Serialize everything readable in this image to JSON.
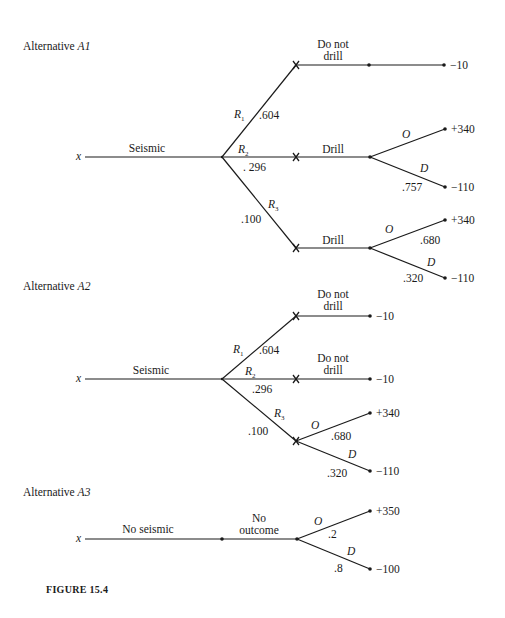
{
  "figure_caption": "FIGURE 15.4",
  "alternatives": [
    {
      "id": "A1",
      "title_prefix": "Alternative ",
      "title_var": "A1",
      "title_pos": [
        23,
        50
      ],
      "root": {
        "label": "x",
        "pos": [
          76,
          160
        ]
      },
      "nodes": [
        {
          "id": "c1",
          "pos": [
            222,
            157
          ],
          "type": "chance"
        },
        {
          "id": "d1",
          "pos": [
            296,
            65
          ],
          "type": "decision-x"
        },
        {
          "id": "d2",
          "pos": [
            296,
            157
          ],
          "type": "decision-x"
        },
        {
          "id": "d3",
          "pos": [
            296,
            248
          ],
          "type": "decision-x"
        },
        {
          "id": "n1",
          "pos": [
            369,
            65
          ],
          "type": "dot"
        },
        {
          "id": "n2",
          "pos": [
            370,
            157
          ],
          "type": "dot"
        },
        {
          "id": "n3",
          "pos": [
            370,
            248
          ],
          "type": "dot"
        },
        {
          "id": "e1",
          "pos": [
            444,
            65
          ],
          "type": "dot"
        },
        {
          "id": "e2",
          "pos": [
            445,
            129
          ],
          "type": "dot"
        },
        {
          "id": "e3",
          "pos": [
            445,
            187
          ],
          "type": "dot"
        },
        {
          "id": "e4",
          "pos": [
            445,
            220
          ],
          "type": "dot"
        },
        {
          "id": "e5",
          "pos": [
            445,
            278
          ],
          "type": "dot"
        }
      ],
      "edges": [
        {
          "from": [
            85,
            157
          ],
          "to": [
            222,
            157
          ]
        },
        {
          "from": [
            222,
            157
          ],
          "to": [
            296,
            65
          ]
        },
        {
          "from": [
            222,
            157
          ],
          "to": [
            296,
            157
          ]
        },
        {
          "from": [
            222,
            157
          ],
          "to": [
            296,
            248
          ]
        },
        {
          "from": [
            296,
            65
          ],
          "to": [
            444,
            65
          ]
        },
        {
          "from": [
            296,
            157
          ],
          "to": [
            370,
            157
          ]
        },
        {
          "from": [
            370,
            157
          ],
          "to": [
            445,
            129
          ]
        },
        {
          "from": [
            370,
            157
          ],
          "to": [
            445,
            187
          ]
        },
        {
          "from": [
            296,
            248
          ],
          "to": [
            370,
            248
          ]
        },
        {
          "from": [
            370,
            248
          ],
          "to": [
            445,
            220
          ]
        },
        {
          "from": [
            370,
            248
          ],
          "to": [
            445,
            278
          ]
        }
      ],
      "labels": [
        {
          "text": "Seismic",
          "pos": [
            147,
            152
          ],
          "anchor": "middle",
          "italic": false
        },
        {
          "text": "Do not",
          "pos": [
            333,
            48
          ],
          "anchor": "middle",
          "italic": false
        },
        {
          "text": "drill",
          "pos": [
            333,
            60
          ],
          "anchor": "middle",
          "italic": false
        },
        {
          "text": "R",
          "sub": "1",
          "pos": [
            234,
            118
          ],
          "anchor": "start",
          "italic": true
        },
        {
          "text": ".604",
          "pos": [
            259,
            119
          ],
          "anchor": "start",
          "italic": false
        },
        {
          "text": "R",
          "sub": "2",
          "pos": [
            238,
            153
          ],
          "anchor": "start",
          "italic": true
        },
        {
          "text": ". 296",
          "pos": [
            243,
            171
          ],
          "anchor": "start",
          "italic": false
        },
        {
          "text": "R",
          "sub": "3",
          "pos": [
            268,
            208
          ],
          "anchor": "start",
          "italic": true
        },
        {
          "text": ".100",
          "pos": [
            241,
            223
          ],
          "anchor": "start",
          "italic": false
        },
        {
          "text": "Drill",
          "pos": [
            333,
            153
          ],
          "anchor": "middle",
          "italic": false
        },
        {
          "text": "O",
          "pos": [
            402,
            138
          ],
          "anchor": "start",
          "italic": true
        },
        {
          "text": "D",
          "pos": [
            420,
            172
          ],
          "anchor": "start",
          "italic": true
        },
        {
          "text": ".757",
          "pos": [
            402,
            191
          ],
          "anchor": "start",
          "italic": false
        },
        {
          "text": "Drill",
          "pos": [
            333,
            244
          ],
          "anchor": "middle",
          "italic": false
        },
        {
          "text": "O",
          "pos": [
            385,
            233
          ],
          "anchor": "start",
          "italic": true
        },
        {
          "text": ".680",
          "pos": [
            420,
            244
          ],
          "anchor": "start",
          "italic": false
        },
        {
          "text": "D",
          "pos": [
            427,
            266
          ],
          "anchor": "start",
          "italic": true
        },
        {
          "text": ".320",
          "pos": [
            403,
            282
          ],
          "anchor": "start",
          "italic": false
        }
      ],
      "payoffs": [
        {
          "text": "−10",
          "pos": [
            450,
            69
          ]
        },
        {
          "text": "+340",
          "pos": [
            451,
            133
          ]
        },
        {
          "text": "−110",
          "pos": [
            451,
            191
          ]
        },
        {
          "text": "+340",
          "pos": [
            451,
            224
          ]
        },
        {
          "text": "−110",
          "pos": [
            451,
            282
          ]
        }
      ]
    },
    {
      "id": "A2",
      "title_prefix": "Alternative ",
      "title_var": "A2",
      "title_pos": [
        23,
        290
      ],
      "root": {
        "label": "x",
        "pos": [
          76,
          382
        ]
      },
      "nodes": [
        {
          "id": "c1",
          "pos": [
            222,
            379
          ],
          "type": "chance"
        },
        {
          "id": "d1",
          "pos": [
            296,
            316
          ],
          "type": "decision-x"
        },
        {
          "id": "d2",
          "pos": [
            296,
            379
          ],
          "type": "decision-x"
        },
        {
          "id": "d3",
          "pos": [
            296,
            441
          ],
          "type": "decision-x"
        },
        {
          "id": "e1",
          "pos": [
            370,
            316
          ],
          "type": "dot"
        },
        {
          "id": "e2",
          "pos": [
            370,
            379
          ],
          "type": "dot"
        },
        {
          "id": "e3",
          "pos": [
            370,
            413
          ],
          "type": "dot"
        },
        {
          "id": "e4",
          "pos": [
            370,
            471
          ],
          "type": "dot"
        }
      ],
      "edges": [
        {
          "from": [
            85,
            379
          ],
          "to": [
            222,
            379
          ]
        },
        {
          "from": [
            222,
            379
          ],
          "to": [
            296,
            316
          ]
        },
        {
          "from": [
            222,
            379
          ],
          "to": [
            296,
            379
          ]
        },
        {
          "from": [
            222,
            379
          ],
          "to": [
            296,
            441
          ]
        },
        {
          "from": [
            296,
            316
          ],
          "to": [
            370,
            316
          ]
        },
        {
          "from": [
            296,
            379
          ],
          "to": [
            370,
            379
          ]
        },
        {
          "from": [
            296,
            441
          ],
          "to": [
            370,
            413
          ]
        },
        {
          "from": [
            296,
            441
          ],
          "to": [
            370,
            471
          ]
        }
      ],
      "labels": [
        {
          "text": "Seismic",
          "pos": [
            151,
            374
          ],
          "anchor": "middle",
          "italic": false
        },
        {
          "text": "Do not",
          "pos": [
            333,
            298
          ],
          "anchor": "middle",
          "italic": false
        },
        {
          "text": "drill",
          "pos": [
            333,
            310
          ],
          "anchor": "middle",
          "italic": false
        },
        {
          "text": "R",
          "sub": "1",
          "pos": [
            233,
            353
          ],
          "anchor": "start",
          "italic": true
        },
        {
          "text": ".604",
          "pos": [
            259,
            354
          ],
          "anchor": "start",
          "italic": false
        },
        {
          "text": "R",
          "sub": "2",
          "pos": [
            245,
            375
          ],
          "anchor": "start",
          "italic": true
        },
        {
          "text": ".296",
          "pos": [
            252,
            393
          ],
          "anchor": "start",
          "italic": false
        },
        {
          "text": "R",
          "sub": "3",
          "pos": [
            274,
            417
          ],
          "anchor": "start",
          "italic": true
        },
        {
          "text": ".100",
          "pos": [
            248,
            435
          ],
          "anchor": "start",
          "italic": false
        },
        {
          "text": "Do not",
          "pos": [
            333,
            362
          ],
          "anchor": "middle",
          "italic": false
        },
        {
          "text": "drill",
          "pos": [
            333,
            374
          ],
          "anchor": "middle",
          "italic": false
        },
        {
          "text": "O",
          "pos": [
            311,
            429
          ],
          "anchor": "start",
          "italic": true
        },
        {
          "text": ".680",
          "pos": [
            331,
            440
          ],
          "anchor": "start",
          "italic": false
        },
        {
          "text": "D",
          "pos": [
            348,
            458
          ],
          "anchor": "start",
          "italic": true
        },
        {
          "text": ".320",
          "pos": [
            327,
            477
          ],
          "anchor": "start",
          "italic": false
        }
      ],
      "payoffs": [
        {
          "text": "−10",
          "pos": [
            376,
            320
          ]
        },
        {
          "text": "−10",
          "pos": [
            376,
            383
          ]
        },
        {
          "text": "+340",
          "pos": [
            376,
            417
          ]
        },
        {
          "text": "−110",
          "pos": [
            376,
            475
          ]
        }
      ]
    },
    {
      "id": "A3",
      "title_prefix": "Alternative ",
      "title_var": "A3",
      "title_pos": [
        23,
        496
      ],
      "root": {
        "label": "x",
        "pos": [
          76,
          542
        ]
      },
      "nodes": [
        {
          "id": "n1",
          "pos": [
            222,
            539
          ],
          "type": "dot"
        },
        {
          "id": "c1",
          "pos": [
            297,
            539
          ],
          "type": "dot"
        },
        {
          "id": "e1",
          "pos": [
            370,
            511
          ],
          "type": "dot"
        },
        {
          "id": "e2",
          "pos": [
            370,
            569
          ],
          "type": "dot"
        }
      ],
      "edges": [
        {
          "from": [
            85,
            539
          ],
          "to": [
            297,
            539
          ]
        },
        {
          "from": [
            297,
            539
          ],
          "to": [
            370,
            511
          ]
        },
        {
          "from": [
            297,
            539
          ],
          "to": [
            370,
            569
          ]
        }
      ],
      "labels": [
        {
          "text": "No seismic",
          "pos": [
            148,
            533
          ],
          "anchor": "middle",
          "italic": false
        },
        {
          "text": "No",
          "pos": [
            259,
            522
          ],
          "anchor": "middle",
          "italic": false
        },
        {
          "text": "outcome",
          "pos": [
            259,
            534
          ],
          "anchor": "middle",
          "italic": false
        },
        {
          "text": "O",
          "pos": [
            314,
            525
          ],
          "anchor": "start",
          "italic": true
        },
        {
          "text": ".2",
          "pos": [
            328,
            538
          ],
          "anchor": "start",
          "italic": false
        },
        {
          "text": "D",
          "pos": [
            347,
            555
          ],
          "anchor": "start",
          "italic": true
        },
        {
          "text": ".8",
          "pos": [
            334,
            572
          ],
          "anchor": "start",
          "italic": false
        }
      ],
      "payoffs": [
        {
          "text": "+350",
          "pos": [
            376,
            515
          ]
        },
        {
          "text": "−100",
          "pos": [
            376,
            573
          ]
        }
      ]
    }
  ],
  "caption_pos": [
    46,
    593
  ]
}
